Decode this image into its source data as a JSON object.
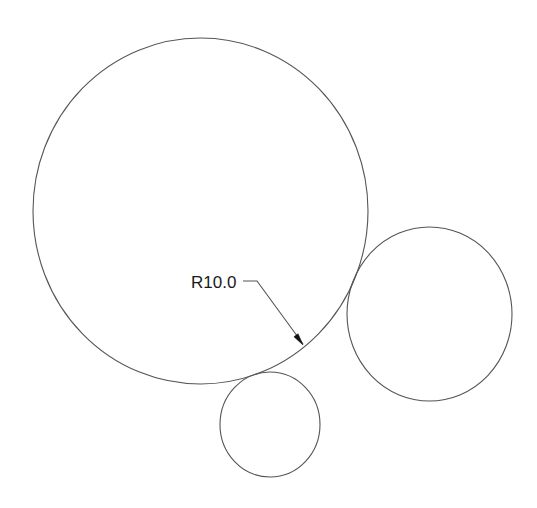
{
  "drawing": {
    "stroke_color": "#555555",
    "text_color": "#1a1a1a",
    "circles": [
      {
        "name": "large-circle",
        "cx": 200.5,
        "cy": 211,
        "rx": 167.5,
        "ry": 173
      },
      {
        "name": "right-circle",
        "cx": 429.5,
        "cy": 314,
        "rx": 82.5,
        "ry": 87
      },
      {
        "name": "small-circle",
        "cx": 270,
        "cy": 424.5,
        "rx": 50,
        "ry": 52.5
      }
    ],
    "dimension": {
      "label": "R10.0",
      "label_x": 191,
      "label_y": 288,
      "leader_points": "243,281 257,281 303,344",
      "arrow_tip": [
        303,
        345
      ]
    }
  }
}
